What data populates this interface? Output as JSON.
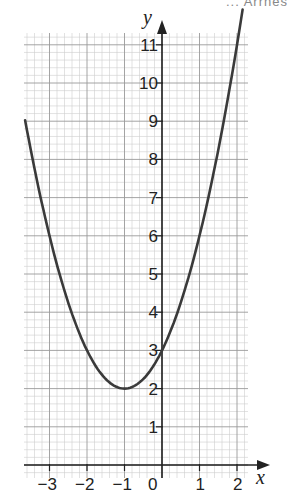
{
  "header_fragment": "... Arrnes",
  "chart_data": {
    "type": "line",
    "title": "",
    "function": "y = x^2 + 2x + 3",
    "xlabel": "x",
    "ylabel": "y",
    "xlim": [
      -3.7,
      2.3
    ],
    "ylim": [
      0,
      11.4
    ],
    "x_ticks": [
      -3,
      -2,
      -1,
      0,
      1,
      2
    ],
    "x_tick_labels": [
      "−3",
      "−2",
      "−1",
      "0",
      "1",
      "2"
    ],
    "y_ticks": [
      1,
      2,
      3,
      4,
      5,
      6,
      7,
      8,
      9,
      10,
      11
    ],
    "y_tick_labels": [
      "1",
      "2",
      "3",
      "4",
      "5",
      "6",
      "7",
      "8",
      "9",
      "10",
      "11"
    ],
    "grid": true,
    "minor_grid_step": 0.2,
    "series": [
      {
        "name": "y = (x+1)^2 + 2",
        "x": [
          -3.65,
          -3.5,
          -3,
          -2.5,
          -2,
          -1.5,
          -1,
          -0.5,
          0,
          0.5,
          1,
          1.5,
          2,
          2.15
        ],
        "y": [
          9.02,
          8.25,
          6,
          4.25,
          3,
          2.25,
          2,
          2.25,
          3,
          4.25,
          6,
          8.25,
          11,
          11.92
        ]
      }
    ],
    "vertex": [
      -1,
      2
    ],
    "y_intercept": 3,
    "legend": null
  }
}
